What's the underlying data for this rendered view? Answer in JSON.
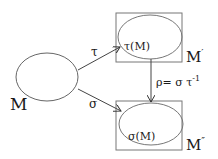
{
  "diagram": {
    "nodes": {
      "source": {
        "label": "M"
      },
      "image_tau": {
        "inner_label": "τ(M)",
        "box_label": "M",
        "box_prime": "′"
      },
      "image_sigma": {
        "inner_label": "σ(M)",
        "box_label": "M",
        "box_prime": "″"
      }
    },
    "edges": {
      "tau": {
        "label": "τ"
      },
      "sigma": {
        "label": "σ"
      },
      "rho": {
        "label_lhs": "ρ= σ τ",
        "label_exp": "-1"
      }
    },
    "colors": {
      "stroke": "#555555",
      "text": "#1a1a1a",
      "background": "#ffffff"
    }
  }
}
